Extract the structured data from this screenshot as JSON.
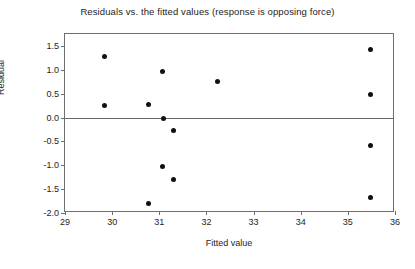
{
  "chart_data": {
    "type": "scatter",
    "title": "Residuals vs. the fitted values (response is opposing force)",
    "xlabel": "Fitted value",
    "ylabel": "Residual",
    "xlim": [
      29,
      36
    ],
    "ylim": [
      -2.0,
      1.75
    ],
    "xticks": [
      29,
      30,
      31,
      32,
      33,
      34,
      35,
      36
    ],
    "xtick_labels": [
      "29",
      "30",
      "31",
      "32",
      "33",
      "34",
      "35",
      "36"
    ],
    "yticks": [
      1.5,
      1.0,
      0.5,
      0.0,
      -0.5,
      -1.0,
      -1.5,
      -2.0
    ],
    "ytick_labels": [
      "1.5",
      "1.0",
      "0.5",
      "0.0",
      "-0.5",
      "-1.0",
      "-1.5",
      "-2.0"
    ],
    "grid": false,
    "legend": "none",
    "reference_line": {
      "axis": "horizontal",
      "y": 0.0,
      "color": "#6a6a6a"
    },
    "marker": {
      "shape": "circle",
      "color": "#111111",
      "size": 5
    },
    "points": [
      {
        "x": 29.83,
        "y": 1.27
      },
      {
        "x": 29.83,
        "y": 0.25
      },
      {
        "x": 30.78,
        "y": 0.28
      },
      {
        "x": 30.78,
        "y": -1.8
      },
      {
        "x": 31.06,
        "y": 0.97
      },
      {
        "x": 31.08,
        "y": -0.01
      },
      {
        "x": 31.06,
        "y": -1.03
      },
      {
        "x": 31.3,
        "y": -0.27
      },
      {
        "x": 31.3,
        "y": -1.29
      },
      {
        "x": 32.23,
        "y": 0.76
      },
      {
        "x": 35.47,
        "y": 1.42
      },
      {
        "x": 35.47,
        "y": 0.48
      },
      {
        "x": 35.47,
        "y": -0.58
      },
      {
        "x": 35.47,
        "y": -1.68
      }
    ]
  }
}
